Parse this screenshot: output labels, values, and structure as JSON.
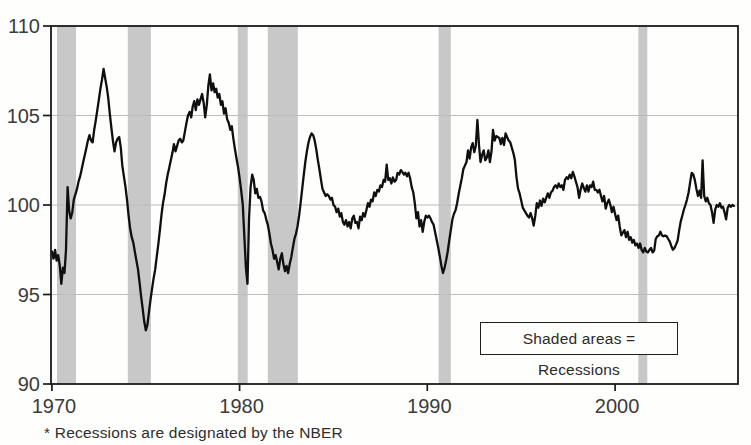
{
  "chart_data": {
    "type": "line",
    "title": "",
    "xlabel": "",
    "ylabel": "",
    "xlim": [
      1969.95,
      2006.55
    ],
    "ylim": [
      90,
      110
    ],
    "x_ticks": [
      1970,
      1980,
      1990,
      2000
    ],
    "y_ticks": [
      110,
      105,
      100,
      95,
      90
    ],
    "gridlines_y": [
      95,
      100,
      105
    ],
    "grid": true,
    "legend_position": "bottom-right-inside",
    "colors": {
      "line": "#0f0f0f",
      "frame": "#1b1b1b",
      "gridline": "#bcbcbc",
      "recession_band": "#c8c8c8",
      "background": "#fefefd"
    },
    "recessions": [
      [
        1970.27,
        1971.28
      ],
      [
        1974.04,
        1975.27
      ],
      [
        1979.9,
        1980.43
      ],
      [
        1981.5,
        1983.1
      ],
      [
        1990.6,
        1991.25
      ],
      [
        2001.24,
        2001.72
      ]
    ],
    "series": [
      {
        "name": "Index (trend = 100)",
        "x_start": 1970.0,
        "points_per_year": 12,
        "values": [
          97.4,
          97.0,
          97.5,
          96.9,
          97.2,
          96.6,
          95.6,
          96.5,
          96.2,
          97.5,
          101.0,
          99.7,
          99.25,
          99.6,
          100.3,
          100.6,
          100.9,
          101.3,
          101.6,
          102.0,
          102.4,
          102.8,
          103.2,
          103.6,
          103.9,
          103.6,
          103.5,
          104.2,
          104.7,
          105.3,
          105.9,
          106.5,
          107.0,
          107.6,
          107.1,
          106.6,
          106.0,
          105.1,
          104.3,
          103.6,
          103.0,
          103.5,
          103.7,
          103.8,
          103.2,
          102.2,
          101.6,
          101.0,
          100.3,
          99.4,
          98.7,
          98.2,
          97.9,
          97.4,
          96.9,
          96.4,
          95.7,
          94.9,
          94.2,
          93.5,
          93.0,
          93.3,
          94.0,
          94.7,
          95.3,
          95.9,
          96.4,
          97.1,
          97.8,
          98.6,
          99.4,
          100.1,
          100.6,
          101.2,
          101.7,
          102.1,
          102.5,
          102.9,
          103.4,
          103.0,
          103.3,
          103.6,
          103.7,
          103.5,
          103.6,
          104.1,
          104.6,
          105.0,
          105.2,
          104.9,
          105.5,
          105.8,
          105.3,
          105.9,
          105.6,
          105.9,
          106.2,
          105.7,
          104.9,
          105.6,
          106.7,
          107.3,
          106.4,
          106.8,
          106.3,
          106.5,
          106.0,
          106.2,
          105.6,
          105.8,
          105.1,
          105.4,
          104.8,
          104.6,
          104.2,
          104.4,
          103.7,
          103.1,
          102.6,
          102.1,
          101.5,
          100.8,
          100.0,
          98.3,
          96.5,
          95.6,
          99.2,
          101.0,
          101.7,
          101.4,
          100.65,
          100.9,
          100.4,
          100.45,
          100.2,
          99.7,
          99.55,
          99.2,
          98.9,
          98.4,
          97.85,
          97.5,
          97.0,
          97.2,
          96.8,
          96.4,
          97.0,
          97.3,
          96.7,
          96.3,
          96.6,
          96.2,
          96.7,
          97.1,
          97.6,
          98.1,
          98.4,
          98.8,
          99.4,
          100.1,
          100.9,
          101.7,
          102.4,
          103.0,
          103.5,
          103.8,
          104.0,
          103.9,
          103.6,
          103.1,
          102.5,
          102.0,
          101.4,
          100.9,
          100.7,
          100.5,
          100.6,
          100.5,
          100.3,
          100.4,
          100.0,
          99.9,
          99.6,
          99.8,
          99.35,
          99.55,
          99.05,
          98.9,
          99.15,
          98.8,
          99.05,
          98.7,
          99.25,
          99.4,
          99.0,
          99.05,
          98.7,
          99.35,
          99.15,
          99.55,
          99.35,
          99.7,
          100.1,
          99.9,
          100.3,
          100.2,
          100.7,
          100.5,
          100.85,
          100.75,
          101.1,
          101.0,
          101.4,
          101.3,
          102.25,
          101.4,
          101.5,
          101.2,
          101.55,
          101.3,
          101.4,
          101.8,
          101.7,
          101.95,
          101.85,
          101.7,
          101.8,
          101.6,
          101.8,
          101.5,
          101.0,
          100.7,
          100.1,
          99.25,
          99.6,
          98.8,
          99.15,
          98.5,
          99.05,
          99.4,
          99.3,
          99.4,
          99.25,
          99.05,
          98.9,
          98.45,
          98.05,
          97.6,
          97.1,
          96.6,
          96.2,
          96.5,
          96.9,
          97.4,
          98.0,
          98.6,
          99.2,
          99.5,
          99.7,
          100.1,
          100.6,
          101.05,
          101.5,
          102.0,
          102.2,
          102.4,
          103.05,
          102.6,
          103.2,
          103.45,
          102.95,
          103.3,
          104.75,
          103.35,
          102.4,
          102.8,
          103.05,
          102.5,
          102.65,
          103.05,
          102.4,
          103.0,
          104.2,
          103.6,
          103.85,
          103.8,
          103.75,
          103.4,
          103.75,
          103.35,
          104.0,
          103.8,
          103.6,
          103.5,
          103.2,
          102.9,
          102.5,
          101.55,
          100.9,
          100.65,
          100.25,
          99.85,
          99.7,
          99.55,
          99.4,
          99.3,
          99.55,
          99.25,
          98.85,
          99.4,
          100.1,
          99.85,
          100.25,
          99.95,
          100.35,
          100.15,
          100.4,
          100.65,
          100.4,
          100.7,
          100.8,
          101.0,
          101.1,
          100.95,
          101.2,
          101.0,
          101.1,
          100.85,
          101.4,
          101.55,
          101.45,
          101.7,
          101.5,
          101.85,
          101.6,
          101.3,
          101.0,
          100.4,
          100.85,
          101.2,
          100.95,
          100.75,
          101.1,
          100.75,
          101.1,
          101.0,
          101.3,
          100.85,
          100.85,
          100.7,
          100.85,
          100.5,
          100.2,
          100.5,
          99.8,
          100.1,
          100.3,
          100.0,
          99.6,
          99.9,
          99.5,
          99.15,
          99.4,
          98.8,
          98.3,
          98.45,
          98.6,
          98.2,
          98.5,
          98.05,
          98.2,
          97.9,
          98.05,
          97.75,
          97.85,
          97.6,
          97.85,
          97.5,
          97.35,
          97.6,
          97.4,
          97.35,
          97.5,
          97.6,
          97.35,
          97.45,
          98.1,
          98.25,
          98.3,
          98.5,
          98.3,
          98.25,
          98.3,
          98.25,
          98.1,
          97.95,
          97.7,
          97.5,
          97.6,
          97.8,
          98.0,
          98.6,
          99.1,
          99.4,
          99.75,
          100.0,
          100.3,
          100.7,
          101.25,
          101.8,
          101.7,
          101.4,
          100.9,
          100.5,
          100.8,
          100.4,
          102.5,
          100.5,
          100.2,
          100.4,
          100.1,
          100.0,
          99.6,
          99.0,
          99.75,
          100.0,
          99.9,
          100.1,
          99.85,
          99.9,
          99.6,
          99.2,
          99.85,
          100.0,
          99.9,
          100.0,
          99.95
        ]
      }
    ],
    "legend": {
      "text": "Shaded areas = Recessions"
    },
    "footnote": {
      "text": "* Recessions are designated by the NBER"
    }
  }
}
